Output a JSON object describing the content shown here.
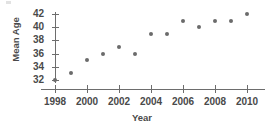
{
  "chart_data": {
    "type": "scatter",
    "title": "",
    "xlabel": "Year",
    "ylabel": "Mean Age",
    "x": [
      1998,
      1999,
      2000,
      2001,
      2002,
      2003,
      2004,
      2005,
      2006,
      2007,
      2008,
      2009,
      2010
    ],
    "values": [
      32,
      33,
      35,
      36,
      37,
      36,
      39,
      39,
      41,
      40,
      41,
      41,
      42
    ],
    "series": [
      {
        "name": "Mean Age",
        "values": [
          32,
          33,
          35,
          36,
          37,
          36,
          39,
          39,
          41,
          40,
          41,
          41,
          42
        ]
      }
    ],
    "points": [
      {
        "x": 1998,
        "y": 32
      },
      {
        "x": 1999,
        "y": 33
      },
      {
        "x": 2000,
        "y": 35
      },
      {
        "x": 2001,
        "y": 36
      },
      {
        "x": 2002,
        "y": 37
      },
      {
        "x": 2003,
        "y": 36
      },
      {
        "x": 2004,
        "y": 39
      },
      {
        "x": 2005,
        "y": 39
      },
      {
        "x": 2006,
        "y": 41
      },
      {
        "x": 2007,
        "y": 40
      },
      {
        "x": 2008,
        "y": 41
      },
      {
        "x": 2009,
        "y": 41
      },
      {
        "x": 2010,
        "y": 42
      }
    ],
    "xlim": [
      1997.5,
      2010.8
    ],
    "ylim": [
      31.6,
      42.4
    ],
    "x_tick_labels": [
      "1998",
      "2000",
      "2002",
      "2004",
      "2006",
      "2008",
      "2010"
    ],
    "x_ticks": [
      1998,
      2000,
      2002,
      2004,
      2006,
      2008,
      2010
    ],
    "y_tick_labels": [
      "42",
      "40",
      "38",
      "36",
      "34",
      "32"
    ],
    "y_ticks": [
      42,
      40,
      38,
      36,
      34,
      32
    ],
    "grid": false,
    "legend": null,
    "legend_position": "none",
    "marker_color": "#6b6b6b",
    "axis_color": "#6d6d6d",
    "text_color": "#4a4a4a",
    "background_color": "#ffffff"
  }
}
